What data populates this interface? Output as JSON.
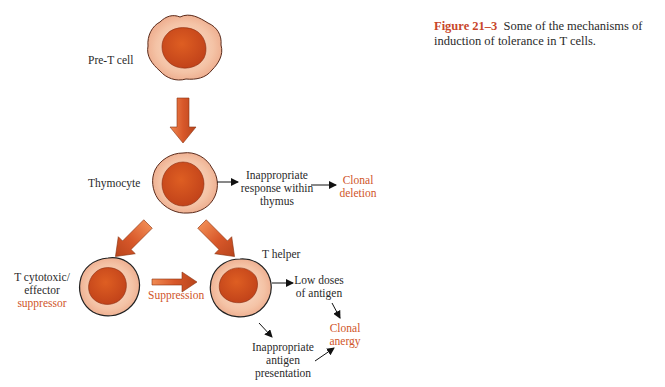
{
  "caption": {
    "figure_label": "Figure 21–3",
    "text": "Some of the mechanisms of induction of tolerance in T cells."
  },
  "cells": {
    "pre_t": {
      "label": "Pre-T cell"
    },
    "thymocyte": {
      "label": "Thymocyte"
    },
    "t_cytotoxic": {
      "label_line1": "T cytotoxic/",
      "label_line2": "effector",
      "label_line3": "suppressor"
    },
    "t_helper": {
      "label": "T helper"
    }
  },
  "outcomes": {
    "thymus": {
      "line1": "Inappropriate",
      "line2": "response within",
      "line3": "thymus"
    },
    "clonal_deletion": {
      "line1": "Clonal",
      "line2": "deletion"
    },
    "suppression": {
      "label": "Suppression"
    },
    "low_doses": {
      "line1": "Low doses",
      "line2": "of antigen"
    },
    "inappropriate_presentation": {
      "line1": "Inappropriate",
      "line2": "antigen",
      "line3": "presentation"
    },
    "clonal_anergy": {
      "line1": "Clonal",
      "line2": "anergy"
    }
  },
  "colors": {
    "accent_text": "#d0552a",
    "figure_label": "#c8462a",
    "cell_cytoplasm": "#f4c2a6",
    "cell_nucleus": "#d2501c",
    "arrow_fill": "#d9602c"
  }
}
